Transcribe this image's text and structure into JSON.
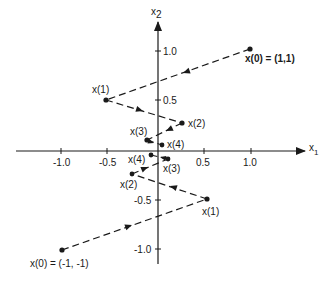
{
  "figure": {
    "axes": {
      "x_label": "x",
      "x_label_sub": "1",
      "y_label": "x",
      "y_label_sub": "2",
      "x_ticks": [
        {
          "value": -1.0,
          "label": "-1.0"
        },
        {
          "value": -0.5,
          "label": "-0.5"
        },
        {
          "value": 0.5,
          "label": "0.5"
        },
        {
          "value": 1.0,
          "label": "1.0"
        }
      ],
      "y_ticks": [
        {
          "value": 1.0,
          "label": "1.0"
        },
        {
          "value": 0.5,
          "label": "0.5"
        },
        {
          "value": -0.5,
          "label": "-0.5"
        },
        {
          "value": -1.0,
          "label": "-1.0"
        }
      ]
    },
    "trajectories": [
      {
        "name": "upper",
        "points": [
          {
            "label": "x(0) = (1,1)",
            "x": 1.0,
            "y": 1.0
          },
          {
            "label": "x(1)",
            "x": -0.55,
            "y": 0.5
          },
          {
            "label": "x(2)",
            "x": 0.25,
            "y": 0.28
          },
          {
            "label": "x(3)",
            "x": -0.12,
            "y": 0.11
          },
          {
            "label": "x(4)",
            "x": 0.04,
            "y": 0.06
          }
        ]
      },
      {
        "name": "lower",
        "points": [
          {
            "label": "x(0) = (-1, -1)",
            "x": -1.0,
            "y": -1.0
          },
          {
            "label": "x(1)",
            "x": 0.52,
            "y": -0.49
          },
          {
            "label": "x(2)",
            "x": -0.27,
            "y": -0.23
          },
          {
            "label": "x(3)",
            "x": 0.1,
            "y": -0.08
          },
          {
            "label": "x(4)",
            "x": -0.07,
            "y": -0.04
          }
        ]
      }
    ]
  },
  "labels": {
    "u0": "x(0) = (1,1)",
    "u1": "x(1)",
    "u2": "x(2)",
    "u3": "x(3)",
    "u4": "x(4)",
    "l0": "x(0) = (-1, -1)",
    "l1": "x(1)",
    "l2": "x(2)",
    "l3": "x(3)",
    "l4": "x(4)",
    "tx_m1": "-1.0",
    "tx_m05": "-0.5",
    "tx_05": "0.5",
    "tx_1": "1.0",
    "ty_1": "1.0",
    "ty_05": "0.5",
    "ty_m05": "-0.5",
    "ty_m1": "-1.0",
    "x1": "x",
    "x1_sub": "1",
    "x2": "x",
    "x2_sub": "2"
  }
}
